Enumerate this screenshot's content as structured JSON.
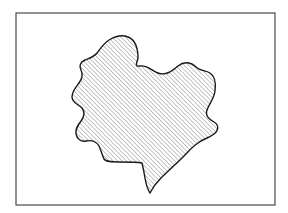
{
  "figure": {
    "caption": "",
    "background_color": "#ffffff",
    "width": 288,
    "height": 213
  },
  "frame": {
    "label": "border-rectangle",
    "x": 16,
    "y": 13,
    "width": 259,
    "height": 192,
    "stroke_color": "#3a3a3a",
    "stroke_width": 1.1,
    "fill": "none"
  },
  "region": {
    "label": "hatched-blob",
    "stroke_color": "#1a1a1a",
    "stroke_width": 1.4,
    "fill_color": "#ffffff",
    "outline_path": "M 125 36 C 135 38 138 48 138 58 C 137 63 134 67 140 66 C 148 65 152 71 158 73 C 166 76 172 71 178 66 C 184 61 191 62 196 67 C 200 71 205 70 210 73 C 215 76 216 83 215 91 C 214 99 209 104 207 110 C 205 116 209 119 214 122 C 219 125 219 130 214 134 C 209 138 203 139 198 143 C 192 147 188 152 183 157 C 176 164 168 171 161 178 C 156 183 152 189 150 193 C 148 190 146 184 145 178 C 144 172 143 167 142 163 C 137 162 128 162 119 162 C 112 162 106 162 104 159 C 102 155 101 150 99 146 C 96 141 91 140 86 141 C 81 142 77 139 76 134 C 75 129 78 125 81 121 C 84 117 85 112 82 108 C 78 104 72 103 72 97 C 72 91 76 87 79 83 C 82 79 83 74 81 70 C 79 66 80 62 85 60 C 90 58 94 57 97 53 C 101 48 104 43 109 40 C 114 37 119 35 125 36 Z",
    "hatch": {
      "angle_degrees": 45,
      "direction": "lower-left to upper-right",
      "spacing_px": 3.1,
      "stroke_color": "#2b2b2b",
      "stroke_width": 0.55
    }
  },
  "icons": {
    "hatch_pattern": "diagonal-hatch-icon",
    "frame": "rectangle-frame-icon",
    "blob": "irregular-closed-curve-icon"
  }
}
